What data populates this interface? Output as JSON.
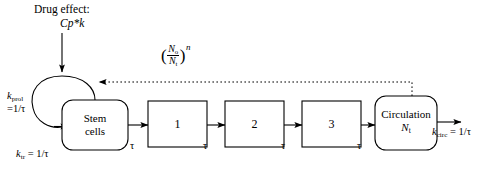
{
  "diagram": {
    "title_text": "Drug effect:",
    "drug_expression": "Cp*k",
    "rate_prol_symbol": "k",
    "rate_prol_sub": "prol",
    "rate_prol_value": "=1/τ",
    "rate_tr_symbol": "k",
    "rate_tr_sub": "tr",
    "rate_tr_value": " = 1/τ",
    "rate_circ_symbol": "k",
    "rate_circ_sub": "circ",
    "rate_circ_value": " = 1/τ",
    "feedback": {
      "numerator": "N",
      "numerator_sub": "o",
      "denominator": "N",
      "denominator_sub": "t",
      "exponent": "n",
      "open_paren": "(",
      "close_paren": ")"
    },
    "nodes": [
      {
        "id": "stem",
        "line1": "Stem",
        "line2": "cells"
      },
      {
        "id": "transit1",
        "line1": "1",
        "line2": ""
      },
      {
        "id": "transit2",
        "line1": "2",
        "line2": ""
      },
      {
        "id": "transit3",
        "line1": "3",
        "line2": ""
      },
      {
        "id": "circulation",
        "line1": "Circulation",
        "line2": "N",
        "line2_sub": "t"
      }
    ],
    "transit_delays": [
      "τ",
      "τ",
      "τ",
      "τ"
    ],
    "colors": {
      "stroke": "#000000",
      "background": "#ffffff",
      "text": "#000000"
    }
  }
}
